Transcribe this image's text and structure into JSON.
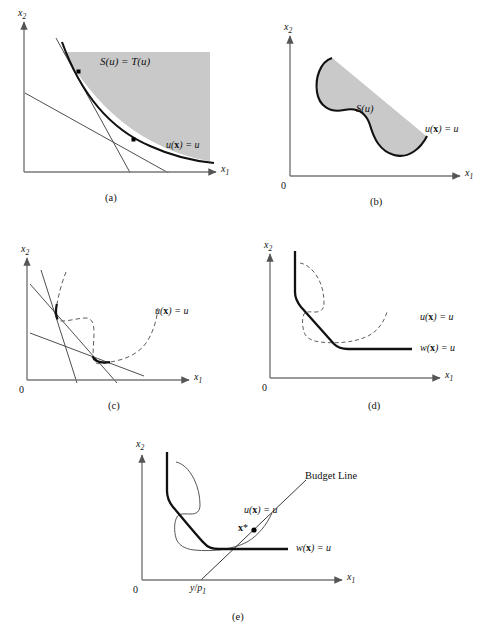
{
  "figure": {
    "title": "",
    "background": "#ffffff",
    "ink": "#111111",
    "shade_color": "#c9c9c9",
    "panels": [
      {
        "id": "a",
        "caption": "(a)",
        "axis_x_label": "x",
        "axis_x_sub": "1",
        "axis_y_label": "x",
        "axis_y_sub": "2",
        "origin_label": "",
        "region_label": "S(u) = T(u)",
        "curve_label_pre": "u(",
        "curve_label_bold": "x",
        "curve_label_post": ") = u",
        "description": "Convex upper contour set shaded; strictly convex indifference curve with two tangent lines touching at two marked points."
      },
      {
        "id": "b",
        "caption": "(b)",
        "axis_x_label": "x",
        "axis_x_sub": "1",
        "axis_y_label": "x",
        "axis_y_sub": "2",
        "origin_label": "0",
        "region_label": "S(u)",
        "curve_label_pre": "u(",
        "curve_label_bold": "x",
        "curve_label_post": ") = u",
        "description": "Non-convex blob region S(u) with a concave notch on its left boundary."
      },
      {
        "id": "c",
        "caption": "(c)",
        "axis_x_label": "x",
        "axis_x_sub": "1",
        "axis_y_label": "x",
        "axis_y_sub": "2",
        "origin_label": "0",
        "region_label": "",
        "curve_label_pre": "u(",
        "curve_label_bold": "x",
        "curve_label_post": ") = u",
        "description": "Dashed non-convex indifference curve with three budget lines of differing slopes; bold arcs mark the tangency segments."
      },
      {
        "id": "d",
        "caption": "(d)",
        "axis_x_label": "x",
        "axis_x_sub": "1",
        "axis_y_label": "x",
        "axis_y_sub": "2",
        "origin_label": "0",
        "region_label": "",
        "curve_label_pre": "u(",
        "curve_label_bold": "x",
        "curve_label_post": ") = u",
        "curve2_label_pre": "w(",
        "curve2_label_bold": "x",
        "curve2_label_post": ") = u",
        "description": "Bold convexified contour w(x)=u (vertical, slanted, horizontal pieces) drawn over the dashed original u(x)=u."
      },
      {
        "id": "e",
        "caption": "(e)",
        "axis_x_label": "x",
        "axis_x_sub": "1",
        "axis_y_label": "x",
        "axis_y_sub": "2",
        "origin_label": "0",
        "budget_label": "Budget Line",
        "optimum_label_bold": "x",
        "optimum_label_star": "*",
        "x_tick_label_num": "y",
        "x_tick_label_den": "p",
        "x_tick_label_den_sub": "1",
        "curve_label_pre": "u(",
        "curve_label_bold": "x",
        "curve_label_post": ") = u",
        "curve2_label_pre": "w(",
        "curve2_label_bold": "x",
        "curve2_label_post": ") = u",
        "description": "Budget line through y/p1 tangent to the convexified contour at the optimum bundle x*."
      }
    ]
  }
}
